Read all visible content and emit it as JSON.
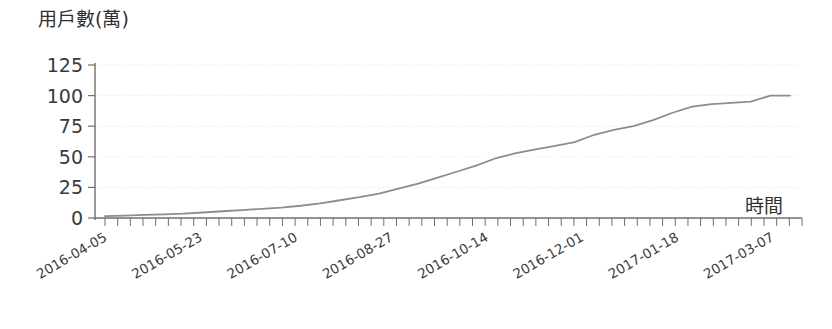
{
  "chart_data": {
    "type": "line",
    "title": "",
    "ylabel": "用戶數(萬)",
    "xlabel": "時間",
    "ylim": [
      0,
      125
    ],
    "yticks": [
      0,
      25,
      50,
      75,
      100,
      125
    ],
    "ytick_labels": [
      "0",
      "25",
      "50",
      "75",
      "100",
      "125"
    ],
    "grid": true,
    "legend": "none",
    "line_color": "#8d8d8d",
    "axis_color": "#6f6f6f",
    "grid_color": "#dcdcdc",
    "text_color": "#2f2f2f",
    "xtick_labels": [
      "2016-04-05",
      "2016-05-23",
      "2016-07-10",
      "2016-08-27",
      "2016-10-14",
      "2016-12-01",
      "2017-01-18",
      "2017-03-07"
    ],
    "xtick_rotation_deg": -30,
    "x_minor_tick_count": 56,
    "series": [
      {
        "name": "用戶數",
        "x": [
          "2016-04-05",
          "2016-04-14",
          "2016-04-23",
          "2016-05-02",
          "2016-05-11",
          "2016-05-23",
          "2016-06-01",
          "2016-06-10",
          "2016-06-19",
          "2016-06-28",
          "2016-07-10",
          "2016-07-19",
          "2016-07-28",
          "2016-08-06",
          "2016-08-15",
          "2016-08-27",
          "2016-09-05",
          "2016-09-14",
          "2016-09-23",
          "2016-10-02",
          "2016-10-14",
          "2016-10-23",
          "2016-11-01",
          "2016-11-10",
          "2016-11-19",
          "2016-12-01",
          "2016-12-10",
          "2016-12-19",
          "2016-12-28",
          "2017-01-06",
          "2017-01-18",
          "2017-01-27",
          "2017-02-05",
          "2017-02-14",
          "2017-02-23",
          "2017-03-07"
        ],
        "values": [
          1.5,
          2,
          2.5,
          3,
          3.5,
          4.5,
          5.5,
          6.5,
          7.5,
          8.5,
          10,
          12,
          14.5,
          17,
          20,
          24,
          28,
          33,
          38,
          43,
          49,
          53,
          56,
          59,
          62,
          68,
          72,
          75,
          80,
          86,
          91,
          93,
          94,
          95,
          100,
          100
        ]
      }
    ]
  }
}
